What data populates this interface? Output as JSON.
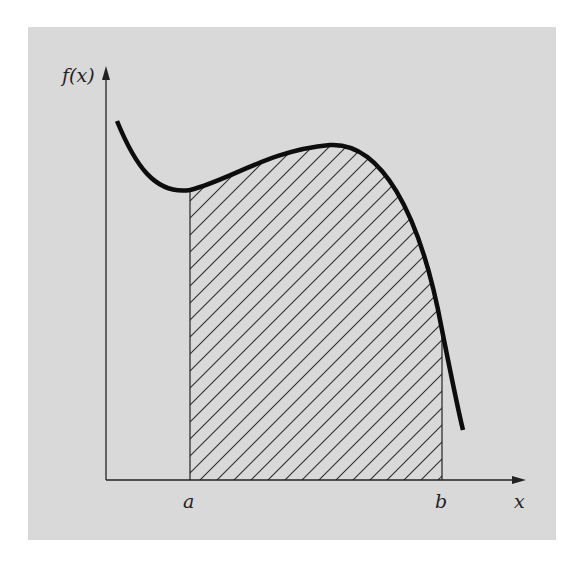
{
  "figure": {
    "background_color": "#d9d9d9",
    "ink_color": "#111111",
    "y_axis_label": "f(x)",
    "x_axis_label": "x",
    "lower_limit_label": "a",
    "upper_limit_label": "b",
    "shaded_region": "hatched area under curve from a to b"
  }
}
